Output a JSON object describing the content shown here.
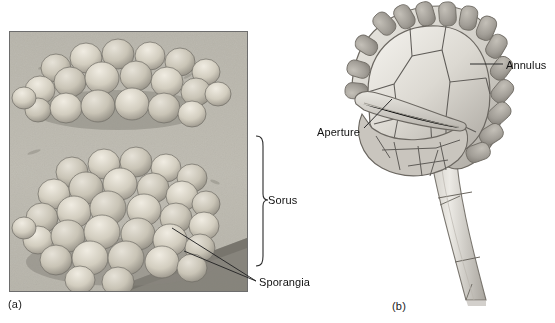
{
  "figure": {
    "panels": [
      {
        "key": "a",
        "label": "(a)",
        "kind": "sem-micrograph",
        "caption_labels": [
          "Sorus",
          "Sporangia"
        ]
      },
      {
        "key": "b",
        "label": "(b)",
        "kind": "line-drawing",
        "caption_labels": [
          "Annulus",
          "Aperture"
        ]
      }
    ]
  },
  "panel_a": {
    "label": "(a)",
    "callouts": {
      "sorus": "Sorus",
      "sporangia": "Sporangia"
    },
    "micrograph": {
      "background_color": "#b9b6ad",
      "border_color": "#6d6d6d",
      "sporangium_fill": "#cdc8bb",
      "shadow_color": "#6f6c65",
      "clusters": [
        {
          "name": "upper-sorus",
          "cx": 110,
          "cy": 62,
          "count": 24
        },
        {
          "name": "lower-sorus",
          "cx": 112,
          "cy": 185,
          "count": 34
        }
      ]
    }
  },
  "panel_b": {
    "label": "(b)",
    "callouts": {
      "annulus": "Annulus",
      "aperture": "Aperture"
    },
    "drawing": {
      "capsule_fill": "#d7d4cd",
      "capsule_stroke": "#6e6b66",
      "cell_stroke": "#5f5c58",
      "annulus_cell_count": 17,
      "stalk_segments": 4
    }
  },
  "colors": {
    "page_background": "#ffffff",
    "text": "#111111",
    "leader_line": "#2b2b2b"
  }
}
